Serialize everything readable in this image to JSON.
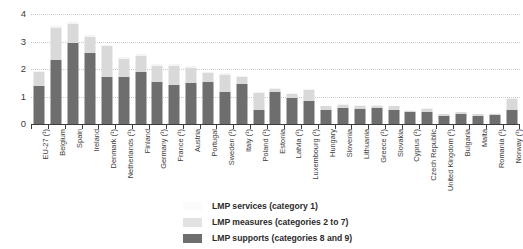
{
  "chart_data": {
    "type": "bar",
    "subtype": "stacked-vertical",
    "title": "",
    "xlabel": "",
    "ylabel": "",
    "ylim": [
      0,
      4
    ],
    "yticks": [
      "0",
      "1",
      "2",
      "3",
      "4"
    ],
    "grid": true,
    "legend_position": "bottom-center",
    "categories": [
      "EU-27 (¹)",
      "Belgium",
      "Spain",
      "Ireland",
      "Denmark (¹)",
      "Netherlands (¹)",
      "Finland",
      "Germany (¹)",
      "France (¹)",
      "Austria",
      "Portugal",
      "Sweden (¹)",
      "Italy (¹)",
      "Poland (¹)",
      "Estonia",
      "Latvia (¹)",
      "Luxembourg (¹)",
      "Hungary",
      "Slovenia",
      "Lithuania",
      "Greece (¹)",
      "Slovakia",
      "Cyprus (¹)",
      "Czech Republic",
      "United Kingdom (¹)",
      "Bulgaria",
      "Malta",
      "Romania (¹)",
      "Norway (¹)"
    ],
    "series": [
      {
        "name": "LMP supports (categories 8 and 9)",
        "color": "#6e6e6e",
        "values": [
          1.38,
          2.33,
          2.95,
          2.58,
          1.72,
          1.7,
          1.88,
          1.52,
          1.42,
          1.5,
          1.52,
          1.18,
          1.45,
          0.52,
          1.15,
          0.95,
          0.82,
          0.52,
          0.6,
          0.55,
          0.6,
          0.52,
          0.45,
          0.42,
          0.3,
          0.38,
          0.3,
          0.32,
          0.52
        ]
      },
      {
        "name": "LMP measures (categories 2 to 7)",
        "color": "#d9d9d9",
        "values": [
          0.5,
          1.18,
          0.7,
          0.6,
          1.1,
          0.65,
          0.6,
          0.6,
          0.7,
          0.55,
          0.32,
          0.6,
          0.25,
          0.6,
          0.12,
          0.15,
          0.4,
          0.12,
          0.1,
          0.1,
          0.06,
          0.12,
          0.04,
          0.12,
          0.06,
          0.04,
          0.05,
          0.05,
          0.38
        ]
      },
      {
        "name": "LMP services (category 1)",
        "color": "#f4f4f4",
        "values": [
          0.06,
          0.06,
          0.05,
          0.05,
          0.06,
          0.08,
          0.05,
          0.06,
          0.06,
          0.05,
          0.04,
          0.08,
          0.04,
          0.04,
          0.03,
          0.03,
          0.04,
          0.02,
          0.03,
          0.03,
          0.02,
          0.03,
          0.02,
          0.03,
          0.02,
          0.02,
          0.02,
          0.02,
          0.05
        ]
      }
    ]
  },
  "legend": {
    "items": [
      {
        "label": "LMP services (category 1)",
        "swatch_class": "sw-services"
      },
      {
        "label": "LMP measures (categories 2 to 7)",
        "swatch_class": "sw-measures"
      },
      {
        "label": "LMP supports (categories 8 and 9)",
        "swatch_class": "sw-supports"
      }
    ]
  }
}
